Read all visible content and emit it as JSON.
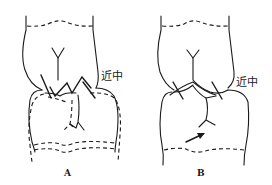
{
  "figure": {
    "panels": [
      {
        "id": "A",
        "caption": "A",
        "direction_label": "近中",
        "description": "Upper and lower teeth in contact; zig-zag contact line with lower tooth outline shown both solid and dashed (displaced position)"
      },
      {
        "id": "B",
        "caption": "B",
        "direction_label": "近中",
        "description": "Upper and lower teeth in contact with two crossing marks; arrow indicates movement direction toward mesial"
      }
    ],
    "colors": {
      "stroke": "#1a1a1a",
      "background": "#ffffff"
    }
  }
}
